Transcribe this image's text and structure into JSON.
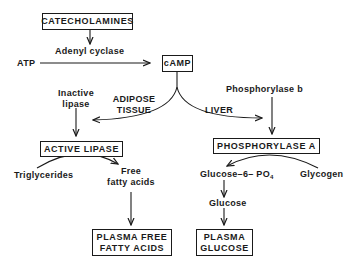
{
  "diagram": {
    "nodes": {
      "catecholamines": "CATECHOLAMINES",
      "camp": "cAMP",
      "active_lipase": "ACTIVE LIPASE",
      "phosphorylase_a": "PHOSPHORYLASE A",
      "plasma_ffa_line1": "PLASMA FREE",
      "plasma_ffa_line2": "FATTY ACIDS",
      "plasma_glucose_line1": "PLASMA",
      "plasma_glucose_line2": "GLUCOSE"
    },
    "labels": {
      "atp": "ATP",
      "adenyl_cyclase": "Adenyl cyclase",
      "inactive_lipase_line1": "Inactive",
      "inactive_lipase_line2": "lipase",
      "adipose_line1": "ADIPOSE",
      "adipose_line2": "TISSUE",
      "liver": "LIVER",
      "phosphorylase_b": "Phosphorylase b",
      "triglycerides": "Triglycerides",
      "ffa_line1": "Free",
      "ffa_line2": "fatty acids",
      "glucose6po4_main": "Glucose–6– PO",
      "glucose6po4_sub": "4",
      "glycogen": "Glycogen",
      "glucose": "Glucose"
    },
    "colors": {
      "ink": "#1a1a1a",
      "background": "#ffffff"
    }
  }
}
